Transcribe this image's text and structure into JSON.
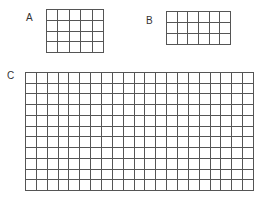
{
  "grids": [
    {
      "label": "A",
      "columns": 5,
      "rows": 4,
      "label_pos": {
        "x": 26,
        "y": 13
      },
      "box": {
        "x": 46,
        "y": 9,
        "w": 58,
        "h": 44
      }
    },
    {
      "label": "B",
      "columns": 6,
      "rows": 3,
      "label_pos": {
        "x": 146,
        "y": 16
      },
      "box": {
        "x": 166,
        "y": 11,
        "w": 65,
        "h": 34
      }
    },
    {
      "label": "C",
      "columns": 21,
      "rows": 11,
      "label_pos": {
        "x": 7,
        "y": 71
      },
      "box": {
        "x": 25,
        "y": 72,
        "w": 229,
        "h": 119
      }
    }
  ],
  "colors": {
    "line": "#555555",
    "label": "#333333",
    "background": "#ffffff"
  }
}
